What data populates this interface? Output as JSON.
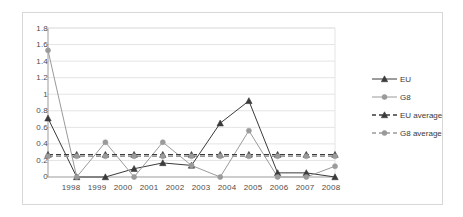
{
  "chart_data": {
    "type": "line",
    "title": "",
    "subtitle": "",
    "xlabel": "",
    "ylabel": "",
    "categories": [
      "1998",
      "1999",
      "2000",
      "2001",
      "2002",
      "2003",
      "2004",
      "2005",
      "2006",
      "2007",
      "2008"
    ],
    "ylim": [
      0,
      1.8
    ],
    "xlim": [
      "1998",
      "2008"
    ],
    "yticks": [
      "0",
      "0.2",
      "0.4",
      "0.6",
      "0.8",
      "1",
      "1.2",
      "1.4",
      "1.6",
      "1.8"
    ],
    "ytick_values": [
      0,
      0.2,
      0.4,
      0.6,
      0.8,
      1.0,
      1.2,
      1.4,
      1.6,
      1.8
    ],
    "grid": true,
    "grid_axis": "y",
    "legend_position": "right",
    "series": [
      {
        "name": "EU",
        "marker": "triangle",
        "color": "#3b3b3b",
        "linestyle": "solid",
        "values": [
          0.71,
          0.0,
          0.0,
          0.1,
          0.17,
          0.14,
          0.65,
          0.92,
          0.05,
          0.05,
          0.0
        ]
      },
      {
        "name": "G8",
        "marker": "circle",
        "color": "#9a9a9a",
        "linestyle": "solid",
        "values": [
          1.53,
          0.0,
          0.42,
          0.0,
          0.42,
          0.14,
          0.0,
          0.56,
          0.0,
          0.0,
          0.13
        ]
      },
      {
        "name": "EU average",
        "marker": "triangle",
        "color": "#3b3b3b",
        "linestyle": "dashed",
        "constant": 0.27,
        "values": [
          0.27,
          0.27,
          0.27,
          0.27,
          0.27,
          0.27,
          0.27,
          0.27,
          0.27,
          0.27,
          0.27
        ]
      },
      {
        "name": "G8 average",
        "marker": "circle",
        "color": "#9a9a9a",
        "linestyle": "dashed",
        "constant": 0.25,
        "values": [
          0.25,
          0.25,
          0.25,
          0.25,
          0.25,
          0.25,
          0.25,
          0.25,
          0.25,
          0.25,
          0.25
        ]
      }
    ],
    "legend": [
      {
        "label": "EU"
      },
      {
        "label": "G8"
      },
      {
        "label": "EU average"
      },
      {
        "label": "G8 average"
      }
    ],
    "colors": {
      "eu": "#3b3b3b",
      "g8": "#9a9a9a",
      "grid": "#e4e4e4",
      "axis": "#9b9b9b",
      "frame": "#d8d8d8",
      "text": "#4c4c4c",
      "background": "#ffffff"
    }
  }
}
